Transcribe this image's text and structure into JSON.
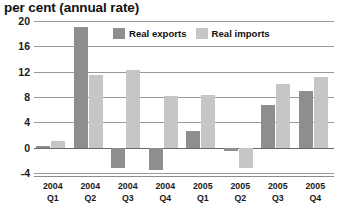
{
  "chart_data": {
    "type": "bar",
    "title": "per cent (annual rate)",
    "xlabel": "",
    "ylabel": "per cent (annual rate)",
    "ylim": [
      -4,
      20
    ],
    "yticks": [
      20,
      16,
      12,
      8,
      4,
      0,
      -4
    ],
    "grid": true,
    "legend_position": "top-center",
    "categories": [
      "2004 Q1",
      "2004 Q2",
      "2004 Q3",
      "2004 Q4",
      "2005 Q1",
      "2005 Q2",
      "2005 Q3",
      "2005 Q4"
    ],
    "category_lines": [
      [
        "2004",
        "Q1"
      ],
      [
        "2004",
        "Q2"
      ],
      [
        "2004",
        "Q3"
      ],
      [
        "2004",
        "Q4"
      ],
      [
        "2005",
        "Q1"
      ],
      [
        "2005",
        "Q2"
      ],
      [
        "2005",
        "Q3"
      ],
      [
        "2005",
        "Q4"
      ]
    ],
    "series": [
      {
        "name": "Real exports",
        "color": "#8e8e8e",
        "values": [
          0.3,
          19.0,
          -3.2,
          -3.5,
          2.7,
          -0.5,
          6.7,
          9.0
        ]
      },
      {
        "name": "Real imports",
        "color": "#c6c6c6",
        "values": [
          1.0,
          11.5,
          12.3,
          8.2,
          8.3,
          -3.2,
          10.0,
          11.2
        ]
      }
    ]
  },
  "legend": {
    "items": [
      {
        "label": "Real exports",
        "swatch": "exports"
      },
      {
        "label": "Real imports",
        "swatch": "imports"
      }
    ]
  }
}
